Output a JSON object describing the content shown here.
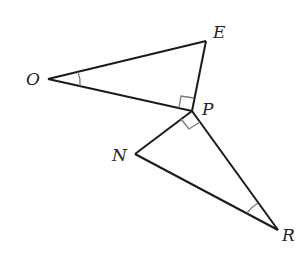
{
  "diagram": {
    "type": "geometry",
    "points": {
      "O": {
        "label": "O",
        "x": 48,
        "y": 79
      },
      "E": {
        "label": "E",
        "x": 206,
        "y": 41
      },
      "P": {
        "label": "P",
        "x": 192,
        "y": 111
      },
      "N": {
        "label": "N",
        "x": 135,
        "y": 154
      },
      "R": {
        "label": "R",
        "x": 278,
        "y": 230
      }
    },
    "segments": [
      "OE",
      "EP",
      "OP",
      "PN",
      "NR",
      "PR"
    ],
    "right_angles": [
      "OPE",
      "NPR"
    ],
    "marked_angles": [
      "EOP",
      "NRP"
    ],
    "colors": {
      "stroke": "#1a1a1a",
      "mark": "#777777"
    }
  }
}
